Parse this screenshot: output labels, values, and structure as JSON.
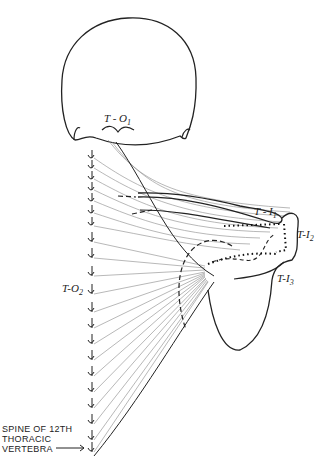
{
  "figure": {
    "labels": {
      "t_o1": {
        "main": "T - O",
        "sub": "1"
      },
      "t_o2": {
        "main": "T-O",
        "sub": "2"
      },
      "t_i1": {
        "main": "T - I",
        "sub": "1"
      },
      "t_i2": {
        "main": "T-I",
        "sub": "2"
      },
      "t_i3": {
        "main": "T-I",
        "sub": "3"
      }
    },
    "caption": {
      "line1": "SPINE OF 12TH",
      "line2": "THORACIC",
      "line3": "VERTEBRA"
    }
  }
}
